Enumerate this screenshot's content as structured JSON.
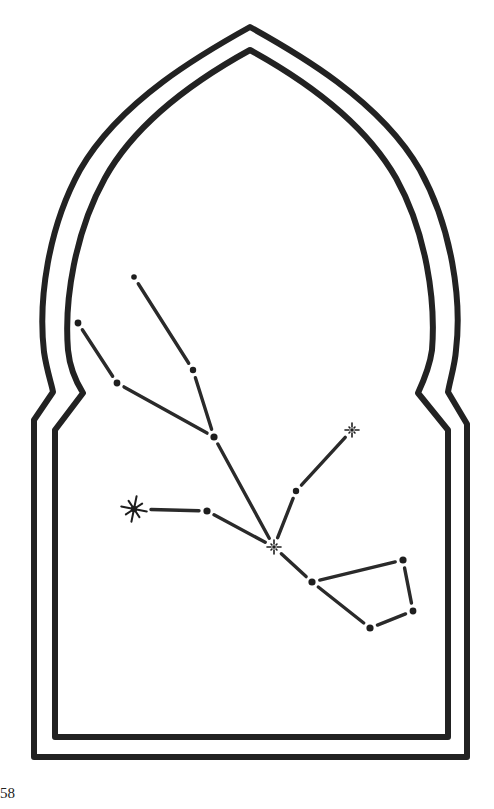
{
  "page": {
    "number": "58"
  },
  "illustration": {
    "subject": "constellation inside an arched window frame",
    "colors": {
      "ink": "#222222",
      "background": "#ffffff"
    },
    "stars": [
      {
        "id": "s1",
        "x": 134,
        "y": 277,
        "type": "dot",
        "r": 2.8
      },
      {
        "id": "s2",
        "x": 193,
        "y": 370,
        "type": "dot",
        "r": 3.2
      },
      {
        "id": "s3",
        "x": 78,
        "y": 323,
        "type": "dot",
        "r": 3.4
      },
      {
        "id": "s4",
        "x": 117,
        "y": 383,
        "type": "dot",
        "r": 3.4
      },
      {
        "id": "s5",
        "x": 214,
        "y": 437,
        "type": "dot",
        "r": 3.6
      },
      {
        "id": "s6",
        "x": 134,
        "y": 509,
        "type": "big-star",
        "r": 13
      },
      {
        "id": "s7",
        "x": 207,
        "y": 511,
        "type": "dot",
        "r": 3.6
      },
      {
        "id": "s8",
        "x": 274,
        "y": 547,
        "type": "small-star",
        "r": 7
      },
      {
        "id": "s9",
        "x": 296,
        "y": 491,
        "type": "dot",
        "r": 3.2
      },
      {
        "id": "s10",
        "x": 352,
        "y": 430,
        "type": "small-star",
        "r": 7
      },
      {
        "id": "s11",
        "x": 312,
        "y": 582,
        "type": "dot",
        "r": 3.6
      },
      {
        "id": "s12",
        "x": 403,
        "y": 560,
        "type": "dot",
        "r": 3.6
      },
      {
        "id": "s13",
        "x": 413,
        "y": 611,
        "type": "dot",
        "r": 3.4
      },
      {
        "id": "s14",
        "x": 370,
        "y": 628,
        "type": "dot",
        "r": 3.6
      }
    ],
    "links": [
      [
        "s1",
        "s2"
      ],
      [
        "s2",
        "s5"
      ],
      [
        "s3",
        "s4"
      ],
      [
        "s4",
        "s5"
      ],
      [
        "s5",
        "s8"
      ],
      [
        "s6",
        "s7"
      ],
      [
        "s7",
        "s8"
      ],
      [
        "s8",
        "s9"
      ],
      [
        "s9",
        "s10"
      ],
      [
        "s8",
        "s11"
      ],
      [
        "s11",
        "s12"
      ],
      [
        "s12",
        "s13"
      ],
      [
        "s13",
        "s14"
      ],
      [
        "s14",
        "s11"
      ]
    ]
  }
}
